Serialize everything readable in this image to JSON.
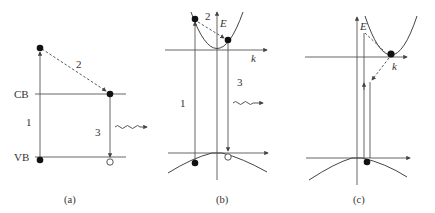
{
  "figure": {
    "panels": [
      {
        "id": "a",
        "caption": "(a)",
        "labels": {
          "cb": "CB",
          "vb": "VB",
          "step1": "1",
          "step2": "2",
          "step3": "3"
        }
      },
      {
        "id": "b",
        "caption": "(b)",
        "labels": {
          "energy_axis": "E",
          "k_axis": "k",
          "step1": "1",
          "step2": "2",
          "step3": "3"
        }
      },
      {
        "id": "c",
        "caption": "(c)",
        "labels": {
          "energy_axis": "E",
          "k_axis": "k"
        }
      }
    ],
    "colors": {
      "line": "#555555",
      "electron": "#111111",
      "hole_fill": "#ffffff"
    }
  }
}
